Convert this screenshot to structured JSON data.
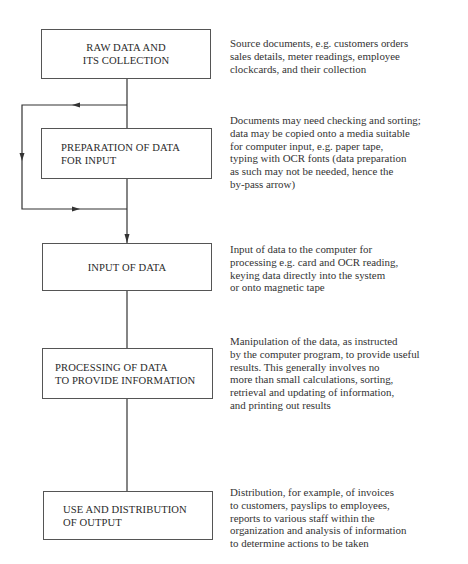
{
  "diagram": {
    "type": "flowchart",
    "colors": {
      "line": "#333333",
      "box_border": "#555555",
      "text": "#2a2a2a"
    },
    "steps": [
      {
        "id": "raw-data",
        "title_lines": [
          "RAW DATA AND",
          "ITS COLLECTION"
        ],
        "description_lines": [
          "Source documents, e.g. customers orders",
          "sales details, meter readings, employee",
          "clockcards, and their collection"
        ]
      },
      {
        "id": "preparation",
        "title_lines": [
          "PREPARATION OF DATA",
          "FOR INPUT"
        ],
        "description_lines": [
          "Documents may need checking and sorting;",
          "data may be copied onto a media suitable",
          "for computer input, e.g. paper tape,",
          "typing with OCR fonts (data preparation",
          "as such may not be needed, hence the",
          "by-pass arrow)"
        ]
      },
      {
        "id": "input",
        "title_lines": [
          "INPUT OF DATA"
        ],
        "description_lines": [
          "Input of data to the computer for",
          "processing e.g. card and OCR reading,",
          "keying data directly into the system",
          "or onto magnetic tape"
        ]
      },
      {
        "id": "processing",
        "title_lines": [
          "PROCESSING OF DATA",
          "TO PROVIDE INFORMATION"
        ],
        "description_lines": [
          "Manipulation of the data, as instructed",
          "by the computer program, to provide useful",
          "results.  This generally involves no",
          "more than small calculations, sorting,",
          "retrieval and updating of information,",
          "and printing out results"
        ]
      },
      {
        "id": "output",
        "title_lines": [
          "USE AND DISTRIBUTION",
          "OF OUTPUT"
        ],
        "description_lines": [
          "Distribution, for example, of invoices",
          "to customers, payslips to employees,",
          "reports to various staff within the",
          "organization and analysis of information",
          "to determine actions to be taken"
        ]
      }
    ],
    "connectors": [
      {
        "from": "raw-data",
        "to": "preparation",
        "style": "line"
      },
      {
        "from": "raw-data",
        "to": "input",
        "style": "bypass-arrow",
        "note": "by-pass around preparation"
      },
      {
        "from": "preparation",
        "to": "input",
        "style": "arrow"
      },
      {
        "from": "input",
        "to": "processing",
        "style": "line"
      },
      {
        "from": "processing",
        "to": "output",
        "style": "line"
      }
    ]
  }
}
